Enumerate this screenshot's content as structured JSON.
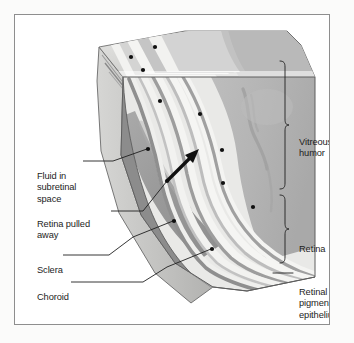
{
  "figure": {
    "type": "medical-illustration",
    "background_color": "#fbfbfa",
    "panel_color": "#ffffff",
    "border_color": "#8e8e8e"
  },
  "labels": {
    "left": [
      {
        "id": "fluid",
        "text": "Fluid in\nsubretinal\nspace"
      },
      {
        "id": "pulled",
        "text": "Retina pulled\naway"
      },
      {
        "id": "sclera",
        "text": "Sclera"
      },
      {
        "id": "choroid",
        "text": "Choroid"
      }
    ],
    "right": [
      {
        "id": "vitreous",
        "text": "Vitreous\nhumor",
        "marker": "brace"
      },
      {
        "id": "retina",
        "text": "Retina",
        "marker": "brace"
      },
      {
        "id": "rpe",
        "text": "Retinal\npigmented\nepithelium",
        "marker": "line"
      }
    ]
  },
  "palette": {
    "vitreous_gray": "#b5b5b5",
    "vitreous_gray_dark": "#a5a5a5",
    "subretinal_fluid": "#9a9a9a",
    "band_light": "#f2f2f0",
    "band_mid": "#cfcfcf",
    "band_dark": "#9d9d9d",
    "sclera": "#e8e8e6",
    "choroid": "#8d8d8d",
    "top_face": "#dcdcda",
    "side_face": "#c3c3c1",
    "outline": "#4a4a4a",
    "leader": "#2a2a2a",
    "text": "#1d1d1d"
  },
  "annotations": {
    "arrow": {
      "label": "traction-arrow",
      "direction": "up-right"
    },
    "leader_dot_count": 11
  }
}
